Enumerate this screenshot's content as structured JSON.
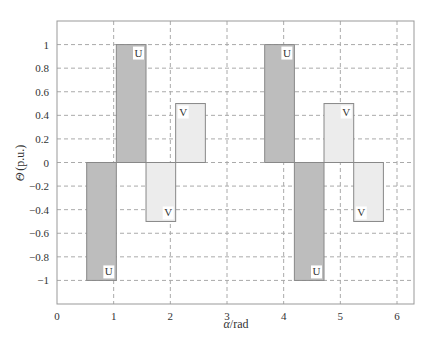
{
  "chart_data": {
    "type": "bar",
    "title": "",
    "xlabel": "α/rad",
    "ylabel": "Θ (p.u.)",
    "xlim": [
      0,
      6.3
    ],
    "ylim": [
      -1.2,
      1.2
    ],
    "grid": true,
    "grid_style": "dashed",
    "xticks": [
      0,
      1,
      2,
      3,
      4,
      5,
      6
    ],
    "xtick_labels": [
      "0",
      "1",
      "2",
      "3",
      "4",
      "5",
      "6"
    ],
    "yticks": [
      1,
      0.8,
      0.6,
      0.4,
      0.2,
      0,
      -0.2,
      -0.4,
      -0.6,
      -0.8,
      -1
    ],
    "ytick_labels": [
      "1",
      "0.8",
      "0.6",
      "0.4",
      "0.2",
      "0",
      "−0.2",
      "−0.4",
      "−0.6",
      "−0.8",
      "−1"
    ],
    "series": [
      {
        "name": "U",
        "color": "#bdbdbd",
        "bars": [
          {
            "x_start": 0.524,
            "x_end": 1.047,
            "value": -1.0,
            "label": "U",
            "label_pos": "bottom-right"
          },
          {
            "x_start": 1.047,
            "x_end": 1.571,
            "value": 1.0,
            "label": "U",
            "label_pos": "top-right"
          },
          {
            "x_start": 3.665,
            "x_end": 4.189,
            "value": 1.0,
            "label": "U",
            "label_pos": "top-right"
          },
          {
            "x_start": 4.189,
            "x_end": 4.712,
            "value": -1.0,
            "label": "U",
            "label_pos": "bottom-right"
          }
        ]
      },
      {
        "name": "V",
        "color": "#ececec",
        "bars": [
          {
            "x_start": 1.571,
            "x_end": 2.094,
            "value": -0.5,
            "label": "V",
            "label_pos": "bottom-right"
          },
          {
            "x_start": 2.094,
            "x_end": 2.618,
            "value": 0.5,
            "label": "V",
            "label_pos": "top-left"
          },
          {
            "x_start": 4.712,
            "x_end": 5.236,
            "value": 0.5,
            "label": "V",
            "label_pos": "top-right"
          },
          {
            "x_start": 5.236,
            "x_end": 5.76,
            "value": -0.5,
            "label": "V",
            "label_pos": "bottom-left"
          }
        ]
      }
    ]
  },
  "axes": {
    "xlabel_italic": "α",
    "xlabel_rest": "/rad",
    "ylabel_italic": "Θ",
    "ylabel_rest": "(p.u.)"
  }
}
